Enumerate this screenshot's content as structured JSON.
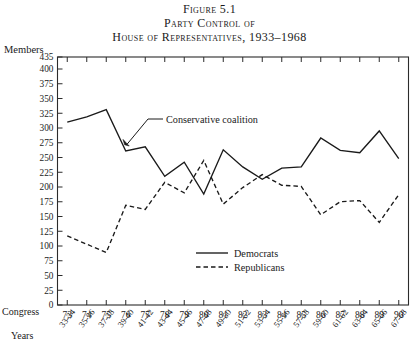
{
  "figure": {
    "number_line": "Figure 5.1",
    "title_line_1": "Party Control of",
    "title_line_2": "House of Representatives, 1933–1968"
  },
  "axes": {
    "y_axis_title": "Members",
    "x_axis_row1_title": "Congress",
    "x_axis_row2_title": "Years"
  },
  "annotation": {
    "text": "Conservative coalition"
  },
  "chart_data": {
    "type": "line",
    "title": "Party Control of House of Representatives, 1933–1968",
    "xlabel": "Congress",
    "ylabel": "Members",
    "ylim": [
      0,
      435
    ],
    "grid": false,
    "legend_position": "inside-lower-right",
    "ytick_labels": [
      "0",
      "25",
      "50",
      "75",
      "100",
      "125",
      "150",
      "175",
      "200",
      "225",
      "250",
      "275",
      "300",
      "325",
      "350",
      "375",
      "400",
      "435"
    ],
    "ytick_values": [
      0,
      25,
      50,
      75,
      100,
      125,
      150,
      175,
      200,
      225,
      250,
      275,
      300,
      325,
      350,
      375,
      400,
      435
    ],
    "categories": [
      "73",
      "74",
      "75",
      "76",
      "77",
      "78",
      "79",
      "80",
      "81",
      "82",
      "83",
      "84",
      "85",
      "86",
      "87",
      "88",
      "89",
      "90"
    ],
    "x_sublabels": [
      "33-34",
      "35-36",
      "37-38",
      "39-40",
      "41-42",
      "43-44",
      "45-46",
      "47-48",
      "49-50",
      "51-52",
      "53-54",
      "55-56",
      "57-58",
      "59-60",
      "61-62",
      "63-64",
      "65-66",
      "67-68"
    ],
    "series": [
      {
        "name": "Democrats",
        "style": "solid",
        "values": [
          310,
          319,
          331,
          261,
          268,
          218,
          242,
          188,
          263,
          234,
          213,
          232,
          234,
          283,
          262,
          258,
          295,
          248
        ]
      },
      {
        "name": "Republicans",
        "style": "dashed",
        "values": [
          117,
          103,
          89,
          169,
          162,
          208,
          190,
          245,
          171,
          199,
          221,
          203,
          201,
          153,
          175,
          177,
          140,
          187
        ]
      }
    ]
  }
}
